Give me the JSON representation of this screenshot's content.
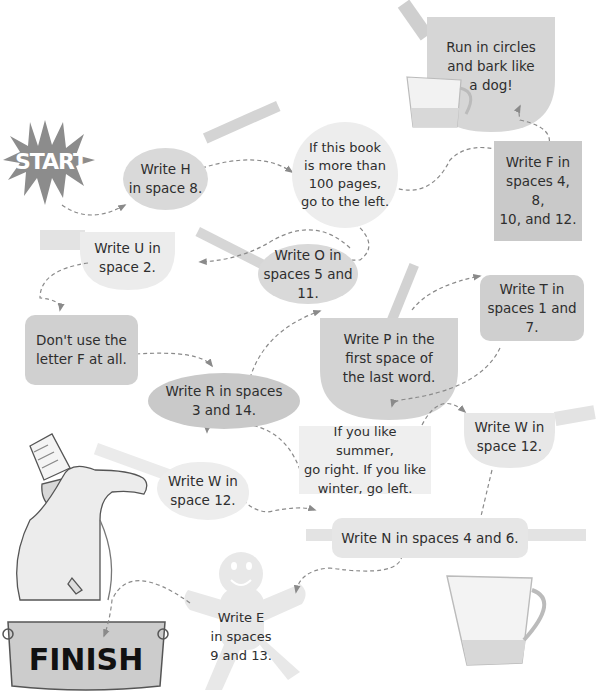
{
  "diagram": {
    "type": "maze-path",
    "start_label": "START",
    "finish_label": "FINISH",
    "colors": {
      "background": "#ffffff",
      "node_dark": "#c9c9c9",
      "node_mid": "#d9d9d9",
      "node_light": "#e6e6e6",
      "arrow": "#8a8a8a",
      "start_star": "#8c8c8c",
      "text": "#2e2e2e"
    },
    "nodes": [
      {
        "id": "write-h",
        "shape": "ladle-oval",
        "text": "Write H\nin space 8."
      },
      {
        "id": "book-pages",
        "shape": "circle",
        "text": "If this book\nis more than\n100 pages,\ngo to the left."
      },
      {
        "id": "write-f",
        "shape": "square",
        "text": "Write F in\nspaces 4, 8,\n10, and 12."
      },
      {
        "id": "run-circles",
        "shape": "bowl",
        "text": "Run in circles\nand bark like\na dog!"
      },
      {
        "id": "write-u",
        "shape": "pan",
        "text": "Write U in\nspace 2."
      },
      {
        "id": "write-o",
        "shape": "spoon-oval",
        "text": "Write O in\nspaces 5 and 11."
      },
      {
        "id": "dont-use-f",
        "shape": "rounded-rect",
        "text": "Don't use the\nletter F at all."
      },
      {
        "id": "write-r",
        "shape": "oval",
        "text": "Write R in spaces\n3 and 14."
      },
      {
        "id": "write-p",
        "shape": "bowl",
        "text": "Write P in the\nfirst space of\nthe last word."
      },
      {
        "id": "write-t",
        "shape": "rounded-rect",
        "text": "Write T in\nspaces 1 and 7."
      },
      {
        "id": "summer-winter",
        "shape": "rect",
        "text": "If you like summer,\ngo right. If you like\nwinter, go left."
      },
      {
        "id": "write-w-right",
        "shape": "pan",
        "text": "Write W in\nspace 12."
      },
      {
        "id": "write-w-left",
        "shape": "spoon-blob",
        "text": "Write W in\nspace 12."
      },
      {
        "id": "write-n",
        "shape": "rolling-pin",
        "text": "Write N in spaces 4 and 6."
      },
      {
        "id": "write-e",
        "shape": "gingerbread-man",
        "text": "Write E\nin spaces\n9 and 13."
      }
    ],
    "edges": [
      [
        "start",
        "write-h"
      ],
      [
        "write-h",
        "book-pages"
      ],
      [
        "book-pages",
        "write-f"
      ],
      [
        "book-pages",
        "write-o"
      ],
      [
        "write-f",
        "run-circles"
      ],
      [
        "write-o",
        "write-u"
      ],
      [
        "write-u",
        "dont-use-f"
      ],
      [
        "dont-use-f",
        "write-r"
      ],
      [
        "write-r",
        "write-p"
      ],
      [
        "write-p",
        "write-t"
      ],
      [
        "write-t",
        "summer-winter"
      ],
      [
        "summer-winter",
        "write-w-right"
      ],
      [
        "summer-winter",
        "write-w-left"
      ],
      [
        "write-w-right",
        "write-n"
      ],
      [
        "write-w-left",
        "write-n"
      ],
      [
        "write-n",
        "write-e"
      ],
      [
        "write-e",
        "finish"
      ]
    ],
    "decorations": [
      "measuring-cup-small",
      "measuring-cup-large",
      "chef-with-salt-shaker",
      "cooking-pot"
    ]
  }
}
